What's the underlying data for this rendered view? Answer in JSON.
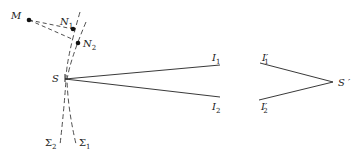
{
  "diagram": {
    "colors": {
      "ink": "#222222",
      "background": "#ffffff"
    },
    "points": {
      "M": {
        "label": "M",
        "sub": ""
      },
      "N1": {
        "label": "N",
        "sub": "1"
      },
      "N2": {
        "label": "N",
        "sub": "2"
      },
      "S": {
        "label": "S",
        "sub": ""
      },
      "I1": {
        "label": "I",
        "sub": "1"
      },
      "I2": {
        "label": "I",
        "sub": "2"
      },
      "I1p": {
        "label": "I′",
        "sub": "1"
      },
      "I2p": {
        "label": "I′",
        "sub": "2"
      },
      "Sp": {
        "label": "S ′",
        "sub": ""
      }
    },
    "surfaces": {
      "Sigma1": {
        "label": "Σ",
        "sub": "1"
      },
      "Sigma2": {
        "label": "Σ",
        "sub": "2"
      }
    }
  }
}
